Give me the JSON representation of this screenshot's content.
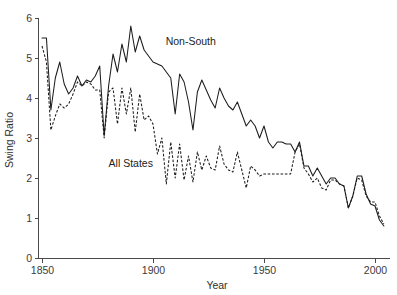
{
  "chart_data": {
    "type": "line",
    "title": "",
    "xlabel": "Year",
    "ylabel": "Swing Ratio",
    "xlim": [
      1848,
      2006
    ],
    "ylim": [
      0,
      6
    ],
    "xticks": [
      1850,
      1900,
      1950,
      2000
    ],
    "xtick_labels": [
      "1850",
      "1900",
      "1950",
      "2000"
    ],
    "yticks": [
      0,
      1,
      2,
      3,
      4,
      5,
      6
    ],
    "ytick_labels": [
      "0",
      "1",
      "2",
      "3",
      "4",
      "5",
      "6"
    ],
    "grid": false,
    "legend_position": "inline-annotations",
    "annotations": [
      {
        "text": "Non-South",
        "x": 1917,
        "y": 5.32
      },
      {
        "text": "All States",
        "x": 1890,
        "y": 2.28
      }
    ],
    "series": [
      {
        "name": "Non-South",
        "style": "solid",
        "x": [
          1850,
          1852,
          1854,
          1856,
          1858,
          1860,
          1862,
          1864,
          1866,
          1868,
          1870,
          1872,
          1874,
          1876,
          1878,
          1880,
          1882,
          1884,
          1886,
          1888,
          1890,
          1892,
          1894,
          1896,
          1898,
          1900,
          1902,
          1904,
          1906,
          1908,
          1910,
          1912,
          1914,
          1916,
          1918,
          1920,
          1922,
          1924,
          1926,
          1928,
          1930,
          1932,
          1934,
          1936,
          1938,
          1940,
          1942,
          1944,
          1946,
          1948,
          1950,
          1952,
          1954,
          1956,
          1958,
          1960,
          1962,
          1964,
          1966,
          1968,
          1970,
          1972,
          1974,
          1976,
          1978,
          1980,
          1982,
          1984,
          1986,
          1988,
          1990,
          1992,
          1994,
          1996,
          1998,
          2000,
          2002,
          2004
        ],
        "y": [
          5.5,
          5.5,
          3.7,
          4.5,
          4.9,
          4.35,
          4.1,
          4.25,
          4.55,
          4.3,
          4.45,
          4.4,
          4.55,
          4.8,
          3.05,
          4.3,
          5.1,
          4.65,
          5.35,
          4.9,
          5.8,
          5.15,
          5.55,
          5.2,
          5.05,
          4.9,
          4.85,
          4.8,
          4.65,
          4.5,
          3.6,
          4.6,
          4.4,
          3.9,
          3.2,
          4.15,
          4.45,
          4.2,
          3.95,
          3.75,
          4.25,
          4.0,
          3.8,
          3.7,
          3.9,
          3.6,
          3.3,
          3.45,
          3.3,
          3.0,
          3.3,
          2.9,
          2.75,
          2.9,
          2.9,
          2.85,
          2.85,
          2.65,
          2.9,
          2.3,
          2.3,
          2.05,
          2.25,
          2.05,
          1.85,
          2.0,
          2.0,
          1.85,
          1.8,
          1.25,
          1.55,
          2.05,
          2.05,
          1.6,
          1.35,
          1.3,
          0.95,
          0.8
        ]
      },
      {
        "name": "All States",
        "style": "dashed",
        "x": [
          1850,
          1852,
          1854,
          1856,
          1858,
          1860,
          1862,
          1864,
          1866,
          1868,
          1870,
          1872,
          1874,
          1876,
          1878,
          1880,
          1882,
          1884,
          1886,
          1888,
          1890,
          1892,
          1894,
          1896,
          1898,
          1900,
          1902,
          1904,
          1906,
          1908,
          1910,
          1912,
          1914,
          1916,
          1918,
          1920,
          1922,
          1924,
          1926,
          1928,
          1930,
          1932,
          1934,
          1936,
          1938,
          1940,
          1942,
          1944,
          1946,
          1948,
          1950,
          1952,
          1954,
          1956,
          1958,
          1960,
          1962,
          1964,
          1966,
          1968,
          1970,
          1972,
          1974,
          1976,
          1978,
          1980,
          1982,
          1984,
          1986,
          1988,
          1990,
          1992,
          1994,
          1996,
          1998,
          2000,
          2002,
          2004
        ],
        "y": [
          5.3,
          4.9,
          3.2,
          3.55,
          3.85,
          3.75,
          3.85,
          4.1,
          4.4,
          4.3,
          4.4,
          4.35,
          4.2,
          4.2,
          3.0,
          4.15,
          4.25,
          3.35,
          4.25,
          3.6,
          4.25,
          3.15,
          4.1,
          3.45,
          3.55,
          3.35,
          2.6,
          3.0,
          1.85,
          2.9,
          2.0,
          2.85,
          1.95,
          2.55,
          1.9,
          2.65,
          2.2,
          2.55,
          2.25,
          2.2,
          2.8,
          2.35,
          2.2,
          2.15,
          2.65,
          2.2,
          1.75,
          2.3,
          2.2,
          2.05,
          2.1,
          2.1,
          2.1,
          2.1,
          2.1,
          2.1,
          2.1,
          2.65,
          2.85,
          2.25,
          2.1,
          1.9,
          2.0,
          1.75,
          1.7,
          1.95,
          1.95,
          1.85,
          1.8,
          1.25,
          1.55,
          2.0,
          1.95,
          1.55,
          1.4,
          1.4,
          1.05,
          0.85
        ]
      }
    ]
  }
}
